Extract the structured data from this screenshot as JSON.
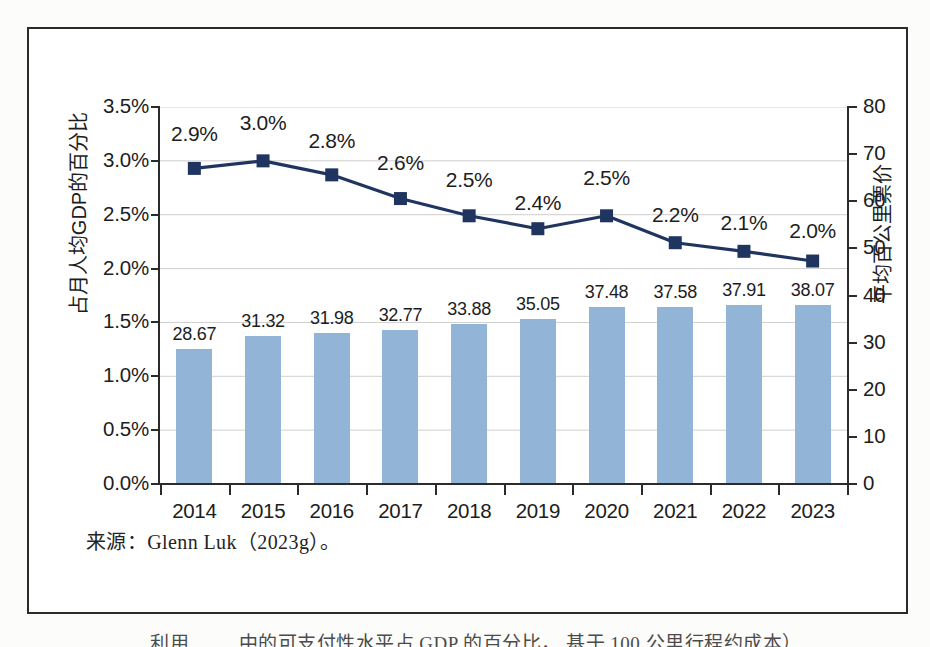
{
  "figure": {
    "source_note": "来源：Glenn Luk（2023g）。",
    "caption_partial": "利用  ……  中的可支付性水平占 GDP 的百分比， 基于 100 公里行程约成本）",
    "bar_color": "#92b4d7",
    "line_color": "#1f3560",
    "frame_color": "#2b2b2b",
    "grid_color": "#cfcfcf"
  },
  "chart_data": {
    "type": "bar",
    "title": "",
    "xlabel": "",
    "ylabel": "占月人均GDP的百分比",
    "y2label": "平均百公里票价",
    "categories": [
      "2014",
      "2015",
      "2016",
      "2017",
      "2018",
      "2019",
      "2020",
      "2021",
      "2022",
      "2023"
    ],
    "grid": true,
    "legend": "none",
    "ylim": [
      0,
      3.5
    ],
    "yticks": [
      "0.0%",
      "0.5%",
      "1.0%",
      "1.5%",
      "2.0%",
      "2.5%",
      "3.0%",
      "3.5%"
    ],
    "ytick_values": [
      0.0,
      0.5,
      1.0,
      1.5,
      2.0,
      2.5,
      3.0,
      3.5
    ],
    "y2lim": [
      0,
      80
    ],
    "y2ticks": [
      "0",
      "10",
      "20",
      "30",
      "40",
      "50",
      "60",
      "70",
      "80"
    ],
    "y2tick_values": [
      0,
      10,
      20,
      30,
      40,
      50,
      60,
      70,
      80
    ],
    "series": [
      {
        "name": "平均百公里票价",
        "type": "bar",
        "axis": "y2",
        "values": [
          28.67,
          31.32,
          31.98,
          32.77,
          33.88,
          35.05,
          37.48,
          37.58,
          37.91,
          38.07
        ],
        "labels": [
          "28.67",
          "31.32",
          "31.98",
          "32.77",
          "33.88",
          "35.05",
          "37.48",
          "37.58",
          "37.91",
          "38.07"
        ],
        "color": "#92b4d7"
      },
      {
        "name": "占月人均GDP的百分比",
        "type": "line",
        "axis": "y1",
        "values": [
          2.93,
          3.0,
          2.87,
          2.65,
          2.49,
          2.37,
          2.49,
          2.24,
          2.16,
          2.07
        ],
        "labels": [
          "2.9%",
          "3.0%",
          "2.8%",
          "2.6%",
          "2.5%",
          "2.4%",
          "2.5%",
          "2.2%",
          "2.1%",
          "2.0%"
        ],
        "color": "#1f3560",
        "marker": "square"
      }
    ]
  }
}
